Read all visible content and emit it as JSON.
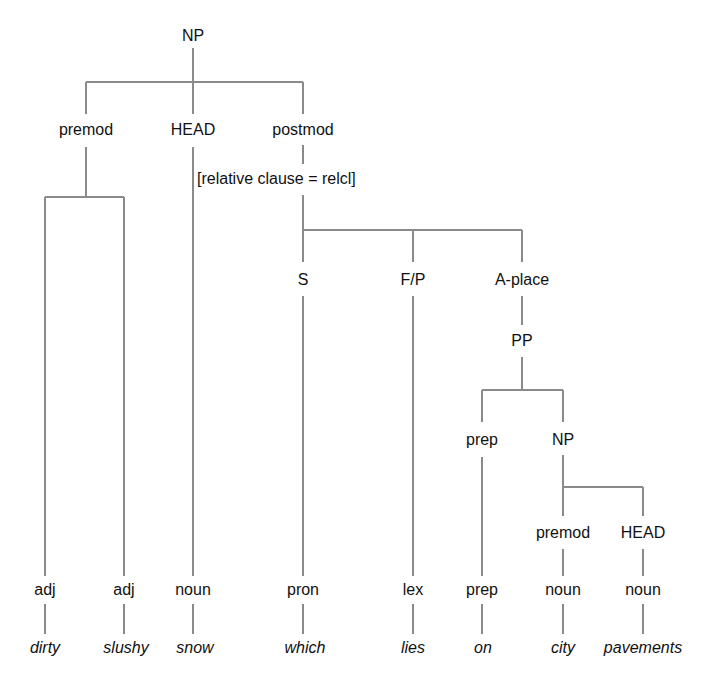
{
  "diagram": {
    "type": "constituency-tree",
    "root": {
      "label": "NP"
    },
    "level1": [
      {
        "label": "premod"
      },
      {
        "label": "HEAD"
      },
      {
        "label": "postmod"
      }
    ],
    "postmod_annotation": "[relative clause = relcl]",
    "relcl_children": [
      {
        "label": "S"
      },
      {
        "label": "F/P"
      },
      {
        "label": "A-place"
      }
    ],
    "pp": {
      "label": "PP"
    },
    "pp_children": [
      {
        "label": "prep"
      },
      {
        "label": "NP"
      }
    ],
    "inner_np_children": [
      {
        "label": "premod"
      },
      {
        "label": "HEAD"
      }
    ],
    "pos_tags": [
      "adj",
      "adj",
      "noun",
      "pron",
      "lex",
      "prep",
      "noun",
      "noun"
    ],
    "words": [
      "dirty",
      "slushy",
      "snow",
      "which",
      "lies",
      "on",
      "city",
      "pavements"
    ],
    "line_color": "#8a8a8a",
    "text_color": "#111111"
  }
}
